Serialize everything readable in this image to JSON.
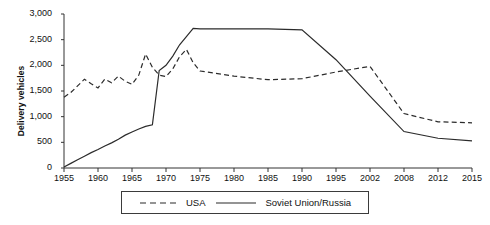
{
  "chart_data": {
    "type": "line",
    "title": "",
    "xlabel": "",
    "ylabel": "Delivery vehicles",
    "ylim": [
      0,
      3000
    ],
    "yticks": [
      0,
      500,
      1000,
      1500,
      2000,
      2500,
      3000
    ],
    "ytick_labels": [
      "0",
      "500",
      "1,000",
      "1,500",
      "2,000",
      "2,500",
      "3,000"
    ],
    "grid": false,
    "legend_position": "bottom-center",
    "x_axis_type": "categorical-unevenly-labeled",
    "xtick_labels": [
      "1955",
      "1960",
      "1965",
      "1970",
      "1975",
      "1980",
      "1985",
      "1990",
      "1995",
      "2002",
      "2008",
      "2012",
      "2015"
    ],
    "x": [
      1955,
      1956,
      1957,
      1958,
      1959,
      1960,
      1961,
      1962,
      1963,
      1964,
      1965,
      1966,
      1967,
      1968,
      1969,
      1970,
      1971,
      1972,
      1973,
      1974,
      1975,
      1980,
      1985,
      1990,
      1995,
      2002,
      2008,
      2012,
      2015
    ],
    "series": [
      {
        "name": "USA",
        "style": "dashed",
        "color": "#2b2b2b",
        "values": [
          1380,
          1470,
          1600,
          1730,
          1640,
          1560,
          1730,
          1660,
          1790,
          1690,
          1630,
          1810,
          2220,
          1960,
          1810,
          1780,
          1930,
          2170,
          2310,
          2050,
          1890,
          1790,
          1720,
          1740,
          1870,
          1980,
          1060,
          900,
          880
        ]
      },
      {
        "name": "Soviet Union/Russia",
        "style": "solid",
        "color": "#2b2b2b",
        "values": [
          20,
          90,
          160,
          230,
          300,
          360,
          430,
          490,
          560,
          640,
          700,
          760,
          810,
          840,
          1900,
          2000,
          2180,
          2400,
          2560,
          2720,
          2710,
          2710,
          2710,
          2690,
          2110,
          1400,
          710,
          580,
          530
        ]
      }
    ]
  },
  "legend": {
    "usa_label": "USA",
    "soviet_label": "Soviet Union/Russia"
  }
}
